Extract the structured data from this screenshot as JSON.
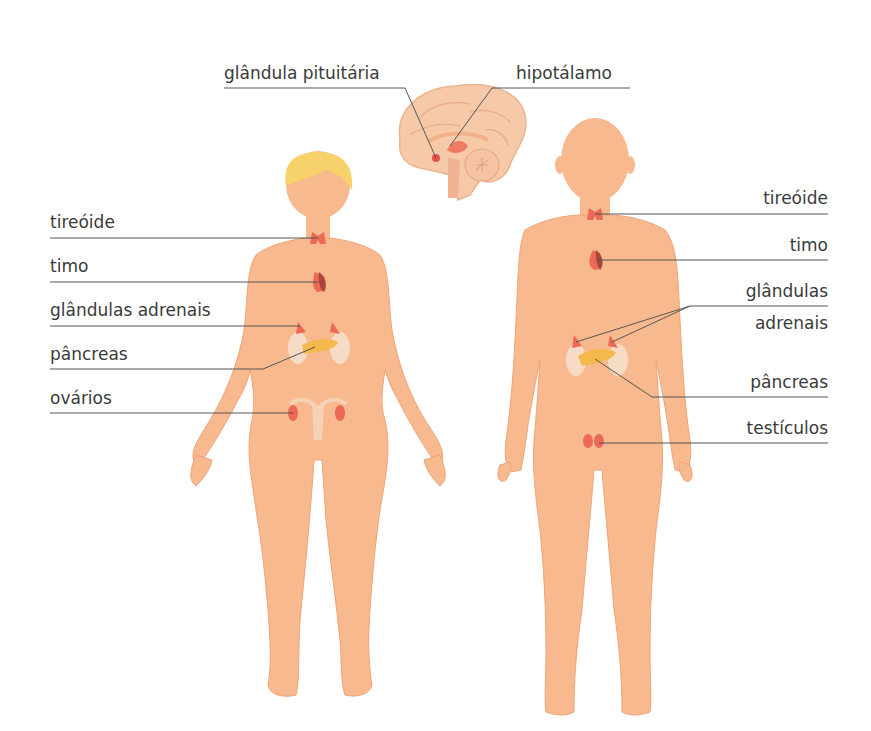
{
  "diagram": {
    "title": "",
    "colors": {
      "skin": "#f8b98f",
      "skin_outline": "#eda57a",
      "hair": "#f7d26a",
      "brain": "#f6c9a8",
      "gland": "#ec6a55",
      "gland_dark": "#a8453c",
      "pancreas": "#f5b84a",
      "kidney": "#f6dcc6",
      "leader_line": "#555555",
      "text": "#3a3a3a"
    },
    "brain_labels": [
      {
        "id": "pituitary",
        "text": "glândula pituitária"
      },
      {
        "id": "hypothalamus",
        "text": "hipotálamo"
      }
    ],
    "female_labels": [
      {
        "id": "thyroid",
        "text": "tireóide"
      },
      {
        "id": "thymus",
        "text": "timo"
      },
      {
        "id": "adrenals",
        "text": "glândulas adrenais"
      },
      {
        "id": "pancreas",
        "text": "pâncreas"
      },
      {
        "id": "ovaries",
        "text": "ovários"
      }
    ],
    "male_labels": [
      {
        "id": "thyroid",
        "text": "tireóide"
      },
      {
        "id": "thymus",
        "text": "timo"
      },
      {
        "id": "adrenals_line1",
        "text": "glândulas"
      },
      {
        "id": "adrenals_line2",
        "text": "adrenais"
      },
      {
        "id": "pancreas",
        "text": "pâncreas"
      },
      {
        "id": "testes",
        "text": "testículos"
      }
    ]
  }
}
